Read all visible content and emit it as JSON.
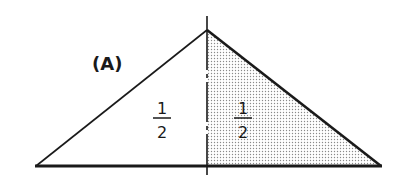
{
  "diagram": {
    "label": "(A)",
    "left_half": {
      "numerator": "1",
      "denominator": "2",
      "shaded": false
    },
    "right_half": {
      "numerator": "1",
      "denominator": "2",
      "shaded": true
    },
    "colors": {
      "stroke": "#1a1a1a",
      "background": "#ffffff",
      "shade_dot": "#8a8a8a"
    }
  }
}
